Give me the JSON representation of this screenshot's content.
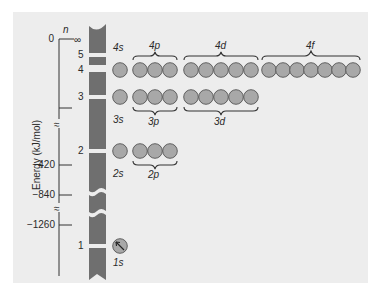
{
  "figure": {
    "y_axis": {
      "label": "Energy (kJ/mol)",
      "ticks": [
        {
          "value": "0",
          "y": 39
        },
        {
          "value": "",
          "y": 108
        },
        {
          "value": "−420",
          "y": 165
        },
        {
          "value": "−840",
          "y": 195
        },
        {
          "value": "−1260",
          "y": 225
        }
      ],
      "break_symbol": "≈"
    },
    "n_axis": {
      "label": "n",
      "levels": [
        {
          "n": "∞",
          "y": 39
        },
        {
          "n": "5",
          "y": 54
        },
        {
          "n": "4",
          "y": 70
        },
        {
          "n": "3",
          "y": 97
        },
        {
          "n": "2",
          "y": 151
        },
        {
          "n": "1",
          "y": 246
        }
      ]
    },
    "subshells": [
      {
        "name": "4s",
        "label": "4s",
        "n": 4,
        "orbitals": 1,
        "label_pos": "above"
      },
      {
        "name": "4p",
        "label": "4p",
        "n": 4,
        "orbitals": 3,
        "label_pos": "above"
      },
      {
        "name": "4d",
        "label": "4d",
        "n": 4,
        "orbitals": 5,
        "label_pos": "above"
      },
      {
        "name": "4f",
        "label": "4f",
        "n": 4,
        "orbitals": 7,
        "label_pos": "above"
      },
      {
        "name": "3s",
        "label": "3s",
        "n": 3,
        "orbitals": 1,
        "label_pos": "below"
      },
      {
        "name": "3p",
        "label": "3p",
        "n": 3,
        "orbitals": 3,
        "label_pos": "below"
      },
      {
        "name": "3d",
        "label": "3d",
        "n": 3,
        "orbitals": 5,
        "label_pos": "below"
      },
      {
        "name": "2s",
        "label": "2s",
        "n": 2,
        "orbitals": 1,
        "label_pos": "below"
      },
      {
        "name": "2p",
        "label": "2p",
        "n": 2,
        "orbitals": 3,
        "label_pos": "below"
      },
      {
        "name": "1s",
        "label": "1s",
        "n": 1,
        "orbitals": 1,
        "label_pos": "below",
        "electron": "↖"
      }
    ],
    "colors": {
      "background": "#ededed",
      "bar": "#6f6f6f",
      "orbital_fill": "#a8a8a8",
      "orbital_stroke": "#555555"
    }
  }
}
